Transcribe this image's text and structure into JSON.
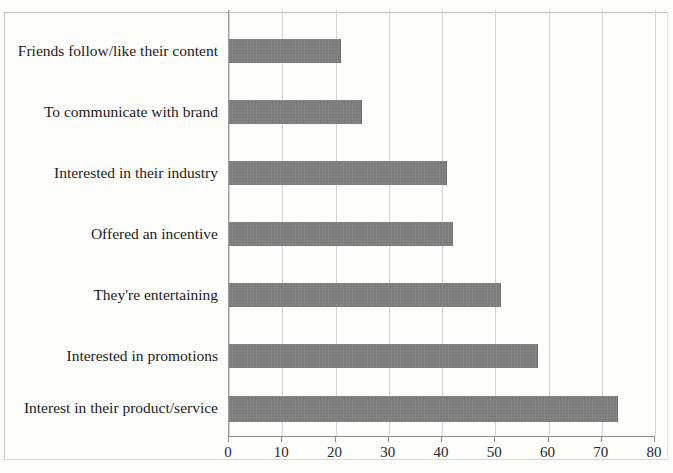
{
  "chart_data": {
    "type": "bar",
    "orientation": "horizontal",
    "title": "",
    "subtitle": "",
    "xlabel": "",
    "ylabel": "",
    "xlim": [
      0,
      80
    ],
    "x_tick_step": 10,
    "x_ticks": [
      "0",
      "10",
      "20",
      "30",
      "40",
      "50",
      "60",
      "70",
      "80"
    ],
    "grid": "vertical",
    "legend": "none",
    "categories": [
      "Friends follow/like their content",
      "To communicate with brand",
      "Interested in their industry",
      "Offered an incentive",
      "They're entertaining",
      "Interested in promotions",
      "Interest in their product/service"
    ],
    "values": [
      21,
      25,
      41,
      42,
      51,
      58,
      73
    ],
    "series": [
      {
        "name": "",
        "values": [
          21,
          25,
          41,
          42,
          51,
          58,
          73
        ]
      }
    ],
    "colors": {
      "bar_fill": "#7e7e7e",
      "gridline": "#d3d3d3",
      "axis": "#8f8f8f",
      "text": "#1b1b1b",
      "background": "#fdfdfc"
    }
  }
}
